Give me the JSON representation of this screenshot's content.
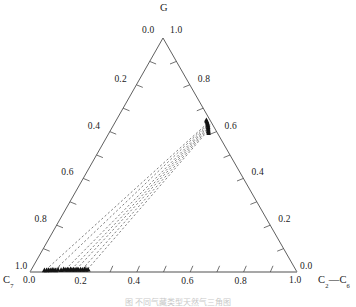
{
  "figure": {
    "caption": "图 不同气藏类型天然气三角图",
    "vertices": {
      "top": "G",
      "bottom_left": "C",
      "bottom_left_sub": "7",
      "bottom_right_a": "C",
      "bottom_right_a_sub": "2",
      "bottom_right_dash": "—",
      "bottom_right_b": "C",
      "bottom_right_b_sub": "6"
    },
    "corner_values": {
      "top_left": "0.0",
      "top_right": "1.0",
      "left_bottom": "1.0",
      "bottom_left_zero": "0.0",
      "right_bottom": "0.0",
      "bottom_right_one": "1.0"
    }
  },
  "chart_data": {
    "type": "scatter",
    "plot_style": "ternary",
    "title": "",
    "axes": {
      "top_vertex_label": "G",
      "bottom_left_vertex_label": "C7",
      "bottom_right_vertex_label": "C2—C6",
      "range": [
        0.0,
        1.0
      ],
      "tick_interval": 0.2,
      "grid": false,
      "legend": "none"
    },
    "left_axis_ticks": [
      "0.0",
      "0.2",
      "0.4",
      "0.6",
      "0.8",
      "1.0"
    ],
    "right_axis_ticks": [
      "1.0",
      "0.8",
      "0.6",
      "0.4",
      "0.2",
      "0.0"
    ],
    "bottom_axis_ticks": [
      "0.0",
      "0.2",
      "0.4",
      "0.6",
      "0.8",
      "1.0"
    ],
    "left_axis_labeled": [
      "0.2",
      "0.4",
      "0.6",
      "0.8"
    ],
    "right_axis_labeled": [
      "0.8",
      "0.6",
      "0.4",
      "0.2"
    ],
    "bottom_axis_labeled": [
      "0.0",
      "0.2",
      "0.4",
      "0.6",
      "0.8",
      "1.0"
    ],
    "marker_shape": "triangle",
    "marker_color": "#111111",
    "tie_line_style": "dashed",
    "tie_line_color": "#555555",
    "tie_lines": [
      {
        "from": [
          0.055,
          0.01,
          0.935
        ],
        "to": [
          0.525,
          0.96,
          0.015
        ]
      },
      {
        "from": [
          0.09,
          0.012,
          0.898
        ],
        "to": [
          0.53,
          0.955,
          0.015
        ]
      },
      {
        "from": [
          0.128,
          0.012,
          0.86
        ],
        "to": [
          0.535,
          0.95,
          0.015
        ]
      },
      {
        "from": [
          0.15,
          0.012,
          0.838
        ],
        "to": [
          0.54,
          0.945,
          0.015
        ]
      },
      {
        "from": [
          0.168,
          0.012,
          0.82
        ],
        "to": [
          0.545,
          0.94,
          0.015
        ]
      },
      {
        "from": [
          0.19,
          0.012,
          0.798
        ],
        "to": [
          0.55,
          0.935,
          0.015
        ]
      },
      {
        "from": [
          0.21,
          0.012,
          0.778
        ],
        "to": [
          0.555,
          0.93,
          0.015
        ]
      }
    ],
    "points_bottom_cluster": [
      [
        0.05,
        0.008,
        0.942
      ],
      [
        0.058,
        0.008,
        0.934
      ],
      [
        0.065,
        0.009,
        0.926
      ],
      [
        0.072,
        0.008,
        0.92
      ],
      [
        0.078,
        0.01,
        0.912
      ],
      [
        0.085,
        0.009,
        0.906
      ],
      [
        0.092,
        0.008,
        0.9
      ],
      [
        0.1,
        0.01,
        0.89
      ],
      [
        0.112,
        0.009,
        0.879
      ],
      [
        0.12,
        0.012,
        0.868
      ],
      [
        0.127,
        0.01,
        0.863
      ],
      [
        0.134,
        0.011,
        0.855
      ],
      [
        0.14,
        0.01,
        0.85
      ],
      [
        0.146,
        0.012,
        0.842
      ],
      [
        0.152,
        0.01,
        0.838
      ],
      [
        0.158,
        0.011,
        0.831
      ],
      [
        0.164,
        0.01,
        0.826
      ],
      [
        0.17,
        0.012,
        0.818
      ],
      [
        0.177,
        0.01,
        0.813
      ],
      [
        0.184,
        0.011,
        0.805
      ],
      [
        0.191,
        0.01,
        0.799
      ],
      [
        0.198,
        0.012,
        0.79
      ],
      [
        0.205,
        0.01,
        0.785
      ],
      [
        0.212,
        0.011,
        0.777
      ]
    ],
    "points_apex_cluster": [
      [
        0.505,
        0.975,
        0.02
      ],
      [
        0.51,
        0.968,
        0.022
      ],
      [
        0.515,
        0.962,
        0.023
      ],
      [
        0.52,
        0.956,
        0.024
      ],
      [
        0.524,
        0.95,
        0.026
      ],
      [
        0.528,
        0.944,
        0.028
      ],
      [
        0.532,
        0.938,
        0.03
      ],
      [
        0.536,
        0.931,
        0.033
      ],
      [
        0.54,
        0.925,
        0.035
      ],
      [
        0.544,
        0.918,
        0.038
      ],
      [
        0.548,
        0.911,
        0.041
      ],
      [
        0.552,
        0.904,
        0.044
      ],
      [
        0.556,
        0.897,
        0.047
      ],
      [
        0.56,
        0.89,
        0.05
      ]
    ]
  }
}
